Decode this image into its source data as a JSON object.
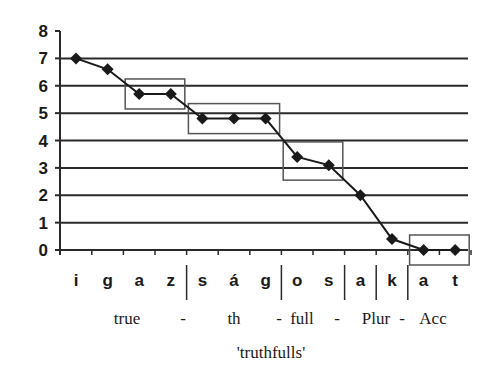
{
  "chart_data": {
    "type": "line",
    "title": "",
    "xlabel": "",
    "ylabel": "",
    "ylim": [
      0,
      8
    ],
    "yticks": [
      0,
      1,
      2,
      3,
      4,
      5,
      6,
      7,
      8
    ],
    "grid": true,
    "legend": null,
    "categories": [
      "i",
      "g",
      "a",
      "z",
      "s",
      "á",
      "g",
      "o",
      "s",
      "a",
      "k",
      "a",
      "t"
    ],
    "series": [
      {
        "name": "pitch",
        "marker": "diamond",
        "values": [
          7.0,
          6.6,
          5.7,
          5.7,
          4.8,
          4.8,
          4.8,
          3.4,
          3.1,
          2.0,
          0.4,
          0.0,
          0.0
        ]
      }
    ],
    "morpheme_boundaries_after_index": [
      3,
      6,
      8,
      9,
      10
    ],
    "highlight_boxes": [
      {
        "from_index": 2,
        "to_index": 3
      },
      {
        "from_index": 4,
        "to_index": 6
      },
      {
        "from_index": 7,
        "to_index": 8
      },
      {
        "from_index": 11,
        "to_index": 12
      }
    ],
    "gloss_line": [
      "true",
      "-",
      "th",
      "-",
      "full",
      "-",
      "Plur",
      "-",
      "Acc"
    ],
    "translation": "'truthfulls'"
  },
  "colors": {
    "line": "#1a1a1a",
    "grid": "#2a2a2a",
    "box": "#555555",
    "background": "#ffffff"
  }
}
